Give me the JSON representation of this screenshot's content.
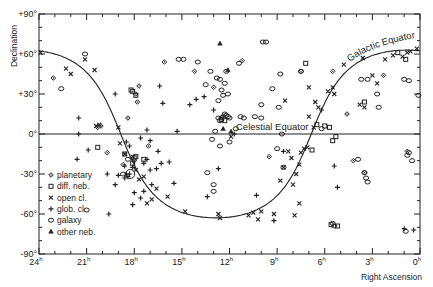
{
  "chart_data": {
    "type": "scatter",
    "title": "",
    "xlabel": "Right Ascension",
    "ylabel": "Declination",
    "xlim": [
      24,
      0
    ],
    "ylim": [
      -90,
      90
    ],
    "x_ticks": [
      {
        "value": 24,
        "label": "24",
        "sup": "h"
      },
      {
        "value": 21,
        "label": "21",
        "sup": "h"
      },
      {
        "value": 18,
        "label": "18",
        "sup": "h"
      },
      {
        "value": 15,
        "label": "15",
        "sup": "h"
      },
      {
        "value": 12,
        "label": "12",
        "sup": "h"
      },
      {
        "value": 9,
        "label": "9",
        "sup": "h"
      },
      {
        "value": 6,
        "label": "6",
        "sup": "h"
      },
      {
        "value": 3,
        "label": "3",
        "sup": "h"
      },
      {
        "value": 0,
        "label": "0",
        "sup": "h"
      }
    ],
    "y_ticks": [
      {
        "value": 90,
        "label": "+90°"
      },
      {
        "value": 60,
        "label": "+60°"
      },
      {
        "value": 30,
        "label": "+30°"
      },
      {
        "value": 0,
        "label": "0°"
      },
      {
        "value": -30,
        "label": "-30°"
      },
      {
        "value": -60,
        "label": "-60°"
      },
      {
        "value": -90,
        "label": "-90°"
      }
    ],
    "grid": false,
    "legend_position": "lower-left",
    "annotations": [
      {
        "text": "Celestial Equator",
        "ra": 9.5,
        "dec": 3
      },
      {
        "text": "Galactic Equator",
        "ra": 3.2,
        "dec": 55
      }
    ],
    "lines": [
      {
        "name": "Celestial Equator",
        "kind": "dec_constant",
        "dec": 0
      },
      {
        "name": "Galactic Equator",
        "kind": "galactic",
        "pole_ra_h": 12.85,
        "pole_dec": 27.1
      }
    ],
    "series": [
      {
        "name": "planetary",
        "marker": "diamond-dot",
        "points": [
          [
            23.1,
            42
          ],
          [
            17.7,
            36
          ],
          [
            16.1,
            54
          ],
          [
            17.9,
            30
          ],
          [
            17.8,
            24
          ],
          [
            18.4,
            12
          ],
          [
            13.0,
            35
          ],
          [
            17.1,
            -9
          ],
          [
            20.3,
            5
          ],
          [
            20.1,
            6
          ],
          [
            18.0,
            -20
          ],
          [
            18.7,
            -23
          ],
          [
            19.7,
            -14
          ],
          [
            4.6,
            15
          ],
          [
            4.2,
            -20
          ],
          [
            3.5,
            -29
          ],
          [
            2.3,
            44
          ],
          [
            0.8,
            -13
          ],
          [
            11.2,
            55
          ],
          [
            14.2,
            47
          ],
          [
            9.5,
            -17
          ],
          [
            7.5,
            47
          ],
          [
            5.5,
            47
          ]
        ]
      },
      {
        "name": "diff. neb.",
        "marker": "square",
        "points": [
          [
            18.2,
            33
          ],
          [
            18.1,
            32
          ],
          [
            17.9,
            29
          ],
          [
            18.0,
            -18
          ],
          [
            17.9,
            -17
          ],
          [
            18.1,
            -22
          ],
          [
            17.4,
            -19
          ],
          [
            6.0,
            6
          ],
          [
            5.7,
            5
          ],
          [
            5.5,
            -5
          ],
          [
            5.3,
            -2
          ],
          [
            3.5,
            24
          ],
          [
            0.9,
            56
          ],
          [
            1.4,
            61
          ],
          [
            6.8,
            -12
          ],
          [
            6.5,
            7
          ],
          [
            5.2,
            -69
          ],
          [
            5.6,
            -68
          ],
          [
            12.3,
            10
          ],
          [
            12.5,
            11
          ],
          [
            7.2,
            53
          ],
          [
            18.6,
            -15
          ],
          [
            20.3,
            -10
          ]
        ]
      },
      {
        "name": "open cl.",
        "marker": "x",
        "points": [
          [
            22.3,
            49
          ],
          [
            22.0,
            45
          ],
          [
            21.1,
            56
          ],
          [
            20.5,
            48
          ],
          [
            23.9,
            61
          ],
          [
            20.4,
            6
          ],
          [
            20.2,
            7
          ],
          [
            19.0,
            5
          ],
          [
            18.9,
            -7
          ],
          [
            18.6,
            -15
          ],
          [
            18.1,
            -17
          ],
          [
            17.9,
            -27
          ],
          [
            17.4,
            -32
          ],
          [
            17.7,
            -34
          ],
          [
            16.6,
            -41
          ],
          [
            16.9,
            -49
          ],
          [
            17.2,
            -52
          ],
          [
            15.9,
            -47
          ],
          [
            14.8,
            -58
          ],
          [
            12.7,
            -60
          ],
          [
            12.6,
            -63
          ],
          [
            10.8,
            -61
          ],
          [
            10.5,
            -59
          ],
          [
            10.0,
            -58
          ],
          [
            10.2,
            -64
          ],
          [
            9.2,
            -60
          ],
          [
            7.9,
            -61
          ],
          [
            7.6,
            -52
          ],
          [
            8.0,
            -38
          ],
          [
            8.8,
            -35
          ],
          [
            8.3,
            -13
          ],
          [
            8.1,
            -18
          ],
          [
            8.6,
            -25
          ],
          [
            7.6,
            -23
          ],
          [
            7.3,
            -11
          ],
          [
            7.5,
            -14
          ],
          [
            7.8,
            -30
          ],
          [
            7.1,
            -10
          ],
          [
            6.7,
            5
          ],
          [
            7.0,
            13
          ],
          [
            6.4,
            20
          ],
          [
            6.6,
            24
          ],
          [
            5.8,
            32
          ],
          [
            5.5,
            35
          ],
          [
            4.8,
            52
          ],
          [
            3.6,
            57
          ],
          [
            3.0,
            44
          ],
          [
            2.7,
            38
          ],
          [
            2.2,
            56
          ],
          [
            1.1,
            58
          ],
          [
            1.7,
            59
          ],
          [
            0.8,
            61
          ],
          [
            0.2,
            64
          ],
          [
            8.5,
            25
          ],
          [
            7.0,
            35
          ],
          [
            11.9,
            -2
          ],
          [
            5.4,
            30
          ],
          [
            0.6,
            62
          ],
          [
            3.8,
            22
          ],
          [
            3.5,
            20
          ]
        ]
      },
      {
        "name": "glob. cl.",
        "marker": "plus",
        "points": [
          [
            21.5,
            12
          ],
          [
            21.5,
            0
          ],
          [
            16.4,
            36
          ],
          [
            16.2,
            23
          ],
          [
            15.3,
            2
          ],
          [
            18.6,
            -24
          ],
          [
            17.6,
            -3
          ],
          [
            17.0,
            -5
          ],
          [
            16.5,
            -13
          ],
          [
            16.6,
            -26
          ],
          [
            17.2,
            -19
          ],
          [
            17.0,
            -27
          ],
          [
            16.3,
            -22
          ],
          [
            17.4,
            -22
          ],
          [
            18.1,
            -25
          ],
          [
            18.3,
            -30
          ],
          [
            18.5,
            -30
          ],
          [
            18.6,
            -33
          ],
          [
            18.4,
            -32
          ],
          [
            17.6,
            -48
          ],
          [
            16.9,
            -38
          ],
          [
            17.4,
            -43
          ],
          [
            18.0,
            -44
          ],
          [
            19.2,
            -38
          ],
          [
            19.0,
            -31
          ],
          [
            19.6,
            -60
          ],
          [
            21.6,
            -19
          ],
          [
            20.9,
            -12
          ],
          [
            19.7,
            -30
          ],
          [
            18.1,
            -53
          ],
          [
            18.3,
            -9
          ],
          [
            19.2,
            30
          ],
          [
            13.0,
            18
          ],
          [
            12.7,
            -26
          ],
          [
            13.4,
            -47
          ],
          [
            15.5,
            -37
          ],
          [
            15.8,
            -21
          ],
          [
            14.1,
            26
          ],
          [
            14.5,
            22
          ],
          [
            10.3,
            -46
          ],
          [
            9.2,
            -65
          ],
          [
            8.6,
            -13
          ],
          [
            5.4,
            -24
          ],
          [
            5.2,
            -40
          ],
          [
            1.0,
            -71
          ],
          [
            0.4,
            -72
          ],
          [
            6.2,
            18
          ],
          [
            11.7,
            0
          ],
          [
            13.6,
            28
          ],
          [
            17.2,
            3
          ],
          [
            18.5,
            -6
          ]
        ]
      },
      {
        "name": "galaxy",
        "marker": "circle",
        "points": [
          [
            22.6,
            34
          ],
          [
            21.1,
            60
          ],
          [
            18.4,
            -19
          ],
          [
            18.7,
            -30
          ],
          [
            12.8,
            42
          ],
          [
            12.6,
            41
          ],
          [
            13.2,
            47
          ],
          [
            12.3,
            15
          ],
          [
            12.4,
            13
          ],
          [
            12.5,
            12
          ],
          [
            12.7,
            12
          ],
          [
            12.1,
            13
          ],
          [
            12.2,
            14
          ],
          [
            12.0,
            12
          ],
          [
            12.6,
            10
          ],
          [
            12.4,
            29
          ],
          [
            12.7,
            25
          ],
          [
            12.5,
            33
          ],
          [
            12.3,
            38
          ],
          [
            12.1,
            30
          ],
          [
            11.3,
            13
          ],
          [
            11.1,
            12
          ],
          [
            10.4,
            13
          ],
          [
            10.0,
            12
          ],
          [
            9.9,
            69
          ],
          [
            9.7,
            69
          ],
          [
            14.0,
            54
          ],
          [
            12.2,
            47
          ],
          [
            15.2,
            56
          ],
          [
            14.9,
            56
          ],
          [
            13.5,
            37
          ],
          [
            11.4,
            53
          ],
          [
            12.9,
            2
          ],
          [
            12.0,
            -6
          ],
          [
            9.3,
            34
          ],
          [
            9.0,
            -11
          ],
          [
            8.9,
            20
          ],
          [
            13.1,
            -4
          ],
          [
            10.0,
            22
          ],
          [
            8.8,
            45
          ],
          [
            11.6,
            4
          ],
          [
            13.4,
            -29
          ],
          [
            13.0,
            -38
          ],
          [
            12.6,
            -9
          ],
          [
            8.6,
            -25
          ],
          [
            3.7,
            41
          ],
          [
            3.3,
            41
          ],
          [
            2.7,
            30
          ],
          [
            2.6,
            20
          ],
          [
            1.0,
            41
          ],
          [
            0.7,
            40
          ],
          [
            0.1,
            29
          ],
          [
            0.8,
            -16
          ],
          [
            0.7,
            -14
          ],
          [
            3.5,
            -29
          ],
          [
            3.4,
            -33
          ],
          [
            3.3,
            -36
          ],
          [
            5.4,
            -69
          ],
          [
            5.5,
            -67
          ],
          [
            0.9,
            -73
          ],
          [
            21.0,
            -57
          ],
          [
            13.0,
            -43
          ],
          [
            7.5,
            47
          ],
          [
            8.7,
            0
          ],
          [
            6.2,
            4
          ],
          [
            3.9,
            -19
          ],
          [
            0.5,
            -20
          ]
        ]
      },
      {
        "name": "other neb.",
        "marker": "triangle",
        "points": [
          [
            12.6,
            68
          ],
          [
            12.1,
            48
          ],
          [
            11.9,
            2
          ],
          [
            12.4,
            4
          ]
        ]
      }
    ]
  },
  "axes": {
    "ylabel": "Declination",
    "xlabel": "Right Ascension"
  },
  "legend": {
    "items": [
      {
        "label": "planetary",
        "marker": "diamond-dot"
      },
      {
        "label": "diff. neb.",
        "marker": "square"
      },
      {
        "label": "open cl.",
        "marker": "x"
      },
      {
        "label": "glob. cl.",
        "marker": "plus"
      },
      {
        "label": "galaxy",
        "marker": "circle"
      },
      {
        "label": "other neb.",
        "marker": "triangle"
      }
    ]
  },
  "colors": {
    "ink": "#222222",
    "background": "#ffffff"
  }
}
